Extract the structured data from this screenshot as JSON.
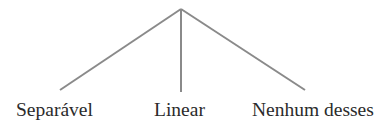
{
  "diagram": {
    "type": "tree",
    "kind": "three-branch-classification-tree",
    "title_remnant": "........",
    "root": {
      "label": "",
      "x": 181,
      "y": 9
    },
    "branches": [
      {
        "id": "branch-left",
        "label": "Separável",
        "from": {
          "x": 181,
          "y": 9
        },
        "to": {
          "x": 60,
          "y": 90
        },
        "label_x": 16
      },
      {
        "id": "branch-middle",
        "label": "Linear",
        "from": {
          "x": 181,
          "y": 9
        },
        "to": {
          "x": 181,
          "y": 92
        },
        "label_x": 154
      },
      {
        "id": "branch-right",
        "label": "Nenhum desses",
        "from": {
          "x": 181,
          "y": 9
        },
        "to": {
          "x": 305,
          "y": 90
        },
        "label_x": 252
      }
    ],
    "colors": {
      "background": "#ffffff",
      "line": "#8a8a8a",
      "text": "#2b2b2b",
      "remnant": "#b9b9b9"
    },
    "line_width": 2
  }
}
